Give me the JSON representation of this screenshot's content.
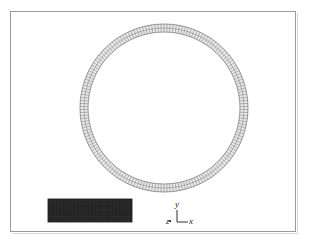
{
  "figure": {
    "name": "finite-element-mesh-figure",
    "background_color": "#ffffff",
    "frame_color": "#9a9a9a",
    "caption": ""
  },
  "ring": {
    "name": "circular-ring-mesh",
    "center_x": 164,
    "center_y": 108,
    "outer_radius": 84,
    "inner_radius": 76,
    "wall_thickness": 8,
    "radial_layers": 2,
    "circumferential_elements": 170,
    "fill_color": "#e8e8e8",
    "line_color": "#6f6f6f"
  },
  "block": {
    "name": "rectangular-block-mesh",
    "x": 48,
    "y": 199,
    "width": 84,
    "height": 23,
    "columns": 60,
    "rows": 10,
    "fill_color": "#3a3a3a",
    "line_color": "#111111"
  },
  "triad": {
    "name": "coordinate-axis-triad",
    "origin_x": 177,
    "origin_y": 222,
    "labels": {
      "y": "y",
      "x": "x",
      "z": "z"
    },
    "line_color": "#1a1a1a"
  },
  "chart_data": {
    "type": "diagram",
    "title": "",
    "elements": [
      {
        "id": "ring",
        "shape": "annulus",
        "center": [
          164,
          108
        ],
        "outer_radius": 84,
        "inner_radius": 76,
        "radial_divisions": 2,
        "circumferential_divisions": 170
      },
      {
        "id": "block",
        "shape": "rectangle",
        "origin": [
          48,
          199
        ],
        "size": [
          84,
          23
        ],
        "x_divisions": 60,
        "y_divisions": 10
      }
    ],
    "axes": [
      "y",
      "x",
      "z"
    ],
    "xlabel": "x",
    "ylabel": "y",
    "zlabel": "z",
    "grid": false,
    "legend": "none"
  }
}
